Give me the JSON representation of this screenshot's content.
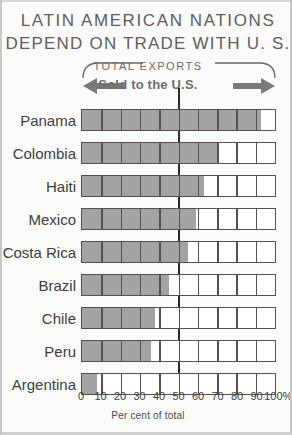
{
  "headline": {
    "line1": "LATIN AMERICAN NATIONS",
    "line2": "DEPEND ON TRADE WITH U. S."
  },
  "legend": {
    "bracket_label": "TOTAL EXPORTS",
    "arrow_label": "Sold to the U.S.",
    "left_arrow_icon": "arrow-left-icon",
    "right_arrow_icon": "arrow-right-icon"
  },
  "axis": {
    "caption": "Per cent of total",
    "ticks": [
      "0",
      "10",
      "20",
      "30",
      "40",
      "50",
      "60",
      "70",
      "80",
      "90",
      "100%"
    ],
    "tick_values": [
      0,
      10,
      20,
      30,
      40,
      50,
      60,
      70,
      80,
      90,
      100
    ],
    "reference_line_value": 50
  },
  "colors": {
    "fill": "#a3a3a3",
    "outline": "#55504c",
    "background": "#fbfbfa",
    "headline_text": "#5e5e5e",
    "label_text": "#3d3d3d"
  },
  "chart_data": {
    "type": "bar",
    "orientation": "horizontal",
    "title": "LATIN AMERICAN NATIONS DEPEND ON TRADE WITH U. S.",
    "subtitle": "TOTAL EXPORTS Sold to the U.S.",
    "xlabel": "Per cent of total",
    "ylabel": "",
    "xlim": [
      0,
      100
    ],
    "grid": true,
    "legend": "none",
    "categories": [
      "Panama",
      "Colombia",
      "Haiti",
      "Mexico",
      "Costa Rica",
      "Brazil",
      "Chile",
      "Peru",
      "Argentina"
    ],
    "values": [
      93,
      70,
      63,
      59,
      55,
      45,
      38,
      36,
      8
    ],
    "series": [
      {
        "name": "Sold to the U.S.",
        "values": [
          93,
          70,
          63,
          59,
          55,
          45,
          38,
          36,
          8
        ]
      }
    ]
  },
  "rows": [
    {
      "label": "Panama",
      "value": 93
    },
    {
      "label": "Colombia",
      "value": 70
    },
    {
      "label": "Haiti",
      "value": 63
    },
    {
      "label": "Mexico",
      "value": 59
    },
    {
      "label": "Costa Rica",
      "value": 55
    },
    {
      "label": "Brazil",
      "value": 45
    },
    {
      "label": "Chile",
      "value": 38
    },
    {
      "label": "Peru",
      "value": 36
    },
    {
      "label": "Argentina",
      "value": 8
    }
  ]
}
